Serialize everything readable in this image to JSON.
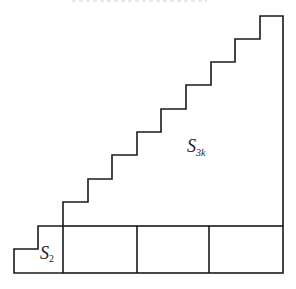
{
  "diagram": {
    "line_color": "#1a1a1a",
    "labels": {
      "large_region": {
        "main": "S",
        "sub": "3k"
      },
      "small_region": {
        "main": "S",
        "sub": "2"
      }
    },
    "staircase": {
      "steps": 9,
      "step_width_px": 24.5,
      "step_height_px": 23.3
    },
    "base_row": {
      "cells": 3
    }
  }
}
